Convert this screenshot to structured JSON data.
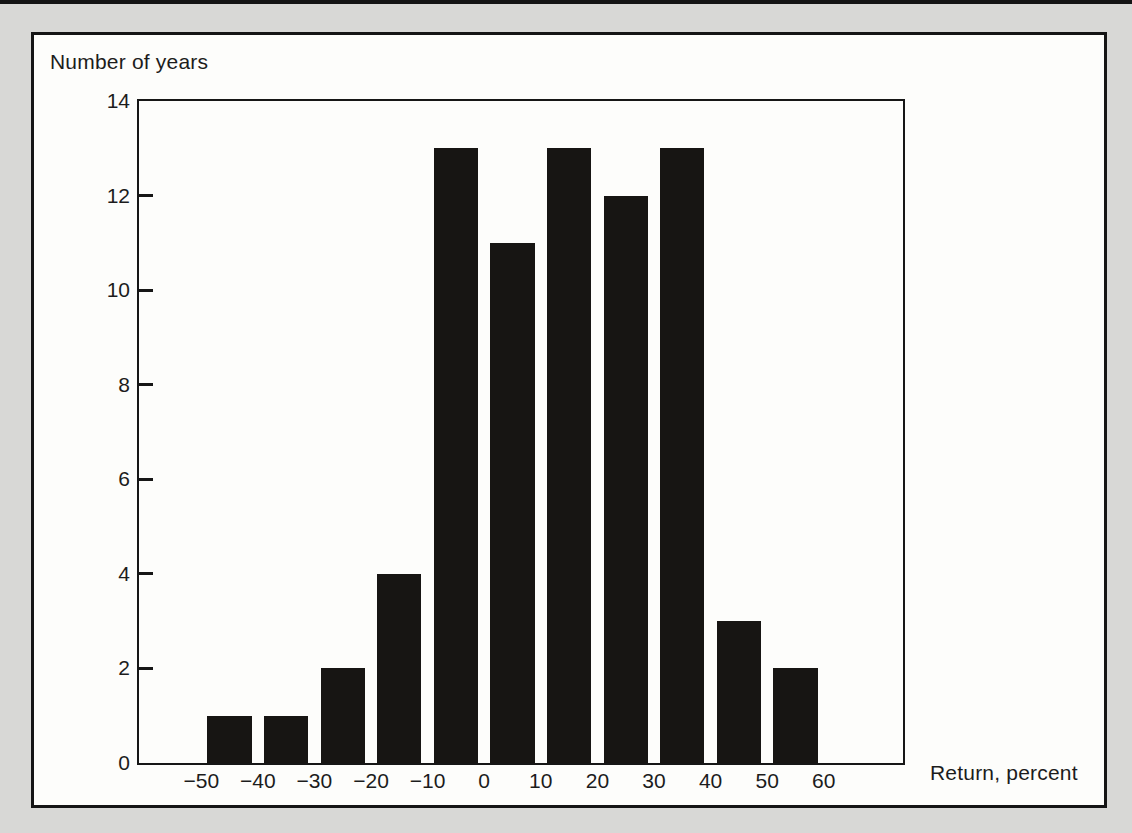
{
  "page": {
    "background_color": "#d8d8d6",
    "figure_background_color": "#fdfdfb",
    "frame_color": "#151515"
  },
  "chart_data": {
    "type": "bar",
    "subtype": "histogram",
    "title": "",
    "ylabel": "Number of years",
    "xlabel": "Return, percent",
    "bin_edges": [
      -50,
      -40,
      -30,
      -20,
      -10,
      0,
      10,
      20,
      30,
      40,
      50,
      60
    ],
    "counts": [
      1,
      1,
      2,
      4,
      13,
      11,
      13,
      12,
      13,
      3,
      2
    ],
    "x_ticks": [
      -50,
      -40,
      -30,
      -20,
      -10,
      0,
      10,
      20,
      30,
      40,
      50,
      60
    ],
    "x_tick_labels": [
      "−50",
      "−40",
      "−30",
      "−20",
      "−10",
      "0",
      "10",
      "20",
      "30",
      "40",
      "50",
      "60"
    ],
    "y_ticks": [
      0,
      2,
      4,
      6,
      8,
      10,
      12,
      14
    ],
    "y_tick_labels": [
      "0",
      "2",
      "4",
      "6",
      "8",
      "10",
      "12",
      "14"
    ],
    "xlim": [
      -61,
      74
    ],
    "ylim": [
      0,
      14
    ],
    "bar_color": "#171513",
    "bar_width_fraction": 0.78,
    "grid": false,
    "legend": "none",
    "plot_border": "full-box"
  }
}
